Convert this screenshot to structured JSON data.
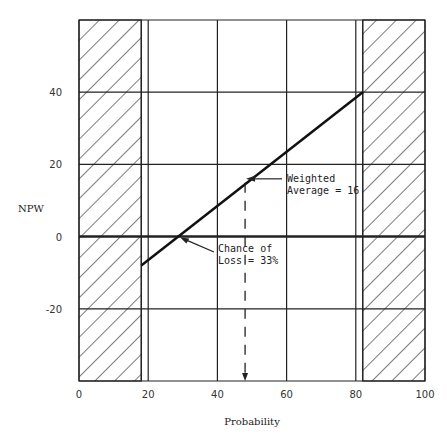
{
  "chart_data": {
    "type": "line",
    "title": "",
    "xlabel": "Probability",
    "ylabel": "NPW",
    "xlim": [
      0,
      100
    ],
    "ylim": [
      -40,
      60
    ],
    "x_ticks": [
      0,
      20,
      40,
      60,
      80,
      100
    ],
    "y_ticks": [
      40,
      20,
      0,
      -20
    ],
    "x_tick_labels": [
      "0",
      "20",
      "40",
      "60",
      "80",
      "100"
    ],
    "y_tick_labels": [
      "40",
      "20",
      "0",
      "-20"
    ],
    "grid": true,
    "series": [
      {
        "name": "NPW vs Probability",
        "x": [
          18,
          82
        ],
        "y": [
          -8,
          40
        ]
      }
    ],
    "zero_line": 0,
    "hatched_regions": [
      {
        "name": "excluded-low",
        "x_from": 0,
        "x_to": 18
      },
      {
        "name": "excluded-high",
        "x_from": 82,
        "x_to": 100
      }
    ],
    "extra_vertical_lines": [
      18,
      82
    ],
    "annotations": [
      {
        "name": "weighted-average",
        "lines": [
          "Weighted",
          "Average = 16"
        ],
        "point": [
          48,
          16
        ]
      },
      {
        "name": "chance-of-loss",
        "lines": [
          "Chance of",
          "Loss = 33%"
        ],
        "point": [
          29,
          0
        ]
      }
    ],
    "dashed_marker_x": 48
  }
}
